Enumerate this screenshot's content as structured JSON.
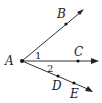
{
  "diagram": {
    "points": [
      {
        "id": "A",
        "label": "A",
        "x": 22,
        "y": 61,
        "lx": 5,
        "ly": 65
      },
      {
        "id": "B",
        "label": "B",
        "x": 66,
        "y": 24,
        "lx": 57,
        "ly": 18
      },
      {
        "id": "C",
        "label": "C",
        "x": 78,
        "y": 61,
        "lx": 74,
        "ly": 56
      },
      {
        "id": "D",
        "label": "D",
        "x": 58,
        "y": 76,
        "lx": 52,
        "ly": 90
      },
      {
        "id": "E",
        "label": "E",
        "x": 74,
        "y": 83,
        "lx": 70,
        "ly": 98
      }
    ],
    "rays": [
      {
        "name": "ray-AB",
        "from": "A",
        "through": "B",
        "end": [
          83,
          10
        ]
      },
      {
        "name": "ray-AC",
        "from": "A",
        "through": "C",
        "end": [
          98,
          61
        ]
      },
      {
        "name": "ray-AE",
        "from": "A",
        "through": "E",
        "end": [
          92,
          91
        ]
      }
    ],
    "angles": [
      {
        "label": "1",
        "x": 35,
        "y": 59,
        "between": [
          "AB",
          "AC"
        ]
      },
      {
        "label": "2",
        "x": 47,
        "y": 72,
        "between": [
          "AC",
          "AE"
        ]
      }
    ],
    "colors": {
      "line": "#333333",
      "point": "#111111",
      "text": "#222222"
    }
  }
}
